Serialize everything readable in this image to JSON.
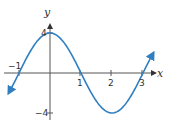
{
  "chart_data": {
    "type": "line",
    "title": "",
    "xlabel": "x",
    "ylabel": "y",
    "x_ticks": [
      -1,
      1,
      2,
      3
    ],
    "y_ticks": [
      4,
      -4
    ],
    "xlim": [
      -1.3,
      3.3
    ],
    "ylim": [
      -4.3,
      4.8
    ],
    "grid": false,
    "series": [
      {
        "name": "y = 4cos(πx/2)",
        "color": "#2f7fc1",
        "x": [
          -1.3,
          -1,
          -0.5,
          0,
          0.5,
          1,
          1.5,
          2,
          2.5,
          3,
          3.3
        ],
        "values": [
          -1.82,
          0,
          2.83,
          4,
          2.83,
          0,
          -2.83,
          -4,
          -2.83,
          0,
          1.82
        ]
      }
    ]
  },
  "labels": {
    "x_axis": "x",
    "y_axis": "y",
    "t_m1": "−1",
    "t_1": "1",
    "t_2": "2",
    "t_3": "3",
    "t_4": "4",
    "t_m4": "−4"
  }
}
